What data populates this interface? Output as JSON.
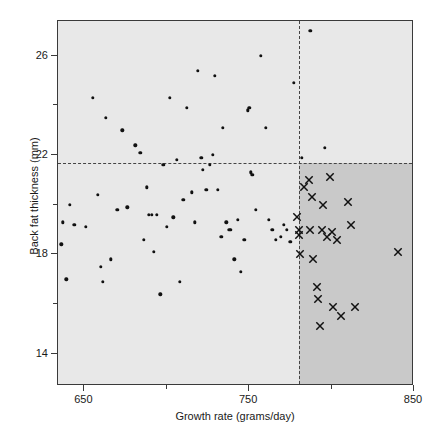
{
  "chart_data": {
    "type": "scatter",
    "title": "",
    "xlabel": "Growth rate (grams/day)",
    "ylabel": "Back fat thickness  (mm)",
    "xlim": [
      634,
      850
    ],
    "ylim": [
      12.7,
      27.4
    ],
    "xticks": [
      650,
      750,
      850
    ],
    "xtick_labels": [
      "650",
      "750",
      "850"
    ],
    "xticks_minor": [
      700,
      800
    ],
    "yticks": [
      14,
      18,
      22,
      26
    ],
    "ytick_labels": [
      "14",
      "18",
      "22",
      "26"
    ],
    "yticks_minor": [
      16,
      20,
      24
    ],
    "grid": false,
    "legend": null,
    "annotations": {
      "growth_rate_threshold": 780,
      "back_fat_threshold": 21.7,
      "shaded_quadrant": "lower-right",
      "selected_marker": "x",
      "unselected_marker": "dot"
    },
    "series": [
      {
        "name": "Unselected animals",
        "marker": "dot",
        "color": "#111111",
        "points": [
          [
            637,
            19.3
          ],
          [
            639,
            17.0
          ],
          [
            636,
            18.4
          ],
          [
            641,
            20.0
          ],
          [
            644,
            19.2
          ],
          [
            651,
            19.1
          ],
          [
            655,
            24.3
          ],
          [
            658,
            20.4
          ],
          [
            660,
            17.5
          ],
          [
            661,
            16.9
          ],
          [
            663,
            23.5
          ],
          [
            666,
            17.8
          ],
          [
            670,
            19.8
          ],
          [
            673,
            23.0
          ],
          [
            676,
            19.9
          ],
          [
            681,
            22.4
          ],
          [
            684,
            22.1
          ],
          [
            686,
            18.6
          ],
          [
            688,
            20.7
          ],
          [
            689,
            19.6
          ],
          [
            691,
            19.6
          ],
          [
            692,
            18.1
          ],
          [
            694,
            19.6
          ],
          [
            696,
            16.4
          ],
          [
            698,
            21.6
          ],
          [
            700,
            19.1
          ],
          [
            702,
            24.3
          ],
          [
            704,
            19.5
          ],
          [
            706,
            21.8
          ],
          [
            708,
            16.9
          ],
          [
            710,
            20.2
          ],
          [
            712,
            23.9
          ],
          [
            715,
            20.5
          ],
          [
            717,
            19.3
          ],
          [
            719,
            25.4
          ],
          [
            721,
            21.9
          ],
          [
            722,
            21.4
          ],
          [
            724,
            20.6
          ],
          [
            726,
            21.6
          ],
          [
            728,
            22.0
          ],
          [
            729,
            25.2
          ],
          [
            731,
            20.6
          ],
          [
            733,
            18.7
          ],
          [
            734,
            23.1
          ],
          [
            736,
            19.3
          ],
          [
            738,
            19.0
          ],
          [
            739,
            19.0
          ],
          [
            741,
            17.8
          ],
          [
            743,
            19.4
          ],
          [
            745,
            17.3
          ],
          [
            747,
            18.6
          ],
          [
            749,
            23.8
          ],
          [
            750,
            23.9
          ],
          [
            751,
            21.3
          ],
          [
            752,
            21.2
          ],
          [
            754,
            19.8
          ],
          [
            757,
            26.0
          ],
          [
            760,
            23.1
          ],
          [
            762,
            19.4
          ],
          [
            764,
            19.0
          ],
          [
            766,
            18.6
          ],
          [
            769,
            18.7
          ],
          [
            771,
            19.2
          ],
          [
            773,
            19.0
          ],
          [
            775,
            18.5
          ],
          [
            777,
            24.9
          ],
          [
            782,
            21.9
          ],
          [
            787,
            27.0
          ],
          [
            796,
            22.3
          ]
        ]
      },
      {
        "name": "Selected animals",
        "marker": "x",
        "color": "#111111",
        "points": [
          [
            779,
            19.5
          ],
          [
            780,
            19.0
          ],
          [
            780,
            18.8
          ],
          [
            781,
            18.0
          ],
          [
            783,
            20.7
          ],
          [
            786,
            21.0
          ],
          [
            787,
            19.0
          ],
          [
            788,
            20.3
          ],
          [
            789,
            17.8
          ],
          [
            791,
            16.7
          ],
          [
            792,
            16.2
          ],
          [
            793,
            15.1
          ],
          [
            794,
            19.0
          ],
          [
            795,
            20.0
          ],
          [
            797,
            18.7
          ],
          [
            799,
            21.1
          ],
          [
            800,
            18.9
          ],
          [
            801,
            15.9
          ],
          [
            803,
            18.6
          ],
          [
            806,
            15.5
          ],
          [
            810,
            20.1
          ],
          [
            812,
            19.2
          ],
          [
            814,
            15.9
          ],
          [
            840,
            18.1
          ],
          [
            853,
            16.0
          ],
          [
            858,
            19.5
          ]
        ]
      }
    ]
  }
}
